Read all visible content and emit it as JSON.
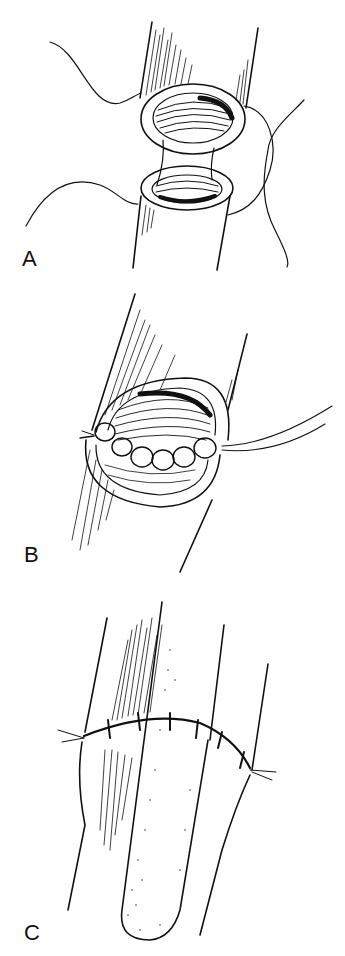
{
  "figure": {
    "panels": [
      {
        "id": "A",
        "label": "A",
        "description": "Two vessel ends with open lumens approximated, stay sutures placed"
      },
      {
        "id": "B",
        "label": "B",
        "description": "Back wall of anastomosis sutured with interrupted stitches"
      },
      {
        "id": "C",
        "label": "C",
        "description": "Completed end-to-end anastomosis with interrupted sutures around circumference"
      }
    ],
    "colors": {
      "ink": "#111111",
      "background": "#ffffff"
    }
  }
}
